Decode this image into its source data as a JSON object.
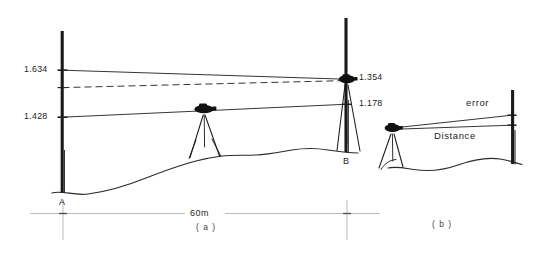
{
  "figure": {
    "colors": {
      "ink": "#1a1a1a",
      "line": "#3a3a3a",
      "dimension": "#9a9a9a",
      "background": "#ffffff"
    }
  },
  "panel_a": {
    "caption": "( a )",
    "staff_left": {
      "point_label": "A",
      "readings": [
        {
          "value": "1.634",
          "kind": "upper-sight"
        },
        {
          "value": "1.428",
          "kind": "lower-sight"
        }
      ]
    },
    "staff_right": {
      "point_label": "B",
      "readings": [
        {
          "value": "1.354",
          "kind": "upper-sight"
        },
        {
          "value": "1.178",
          "kind": "lower-sight"
        }
      ]
    },
    "dimension": {
      "label": "60m"
    },
    "instruments": [
      {
        "name": "level-instrument",
        "position": "midway"
      },
      {
        "name": "level-instrument",
        "position": "at-staff-b"
      }
    ]
  },
  "panel_b": {
    "caption": "( b )",
    "labels": {
      "error": "error",
      "distance": "Distance"
    },
    "instruments": [
      {
        "name": "level-instrument",
        "position": "left"
      }
    ],
    "staff": {
      "name": "staff"
    }
  }
}
